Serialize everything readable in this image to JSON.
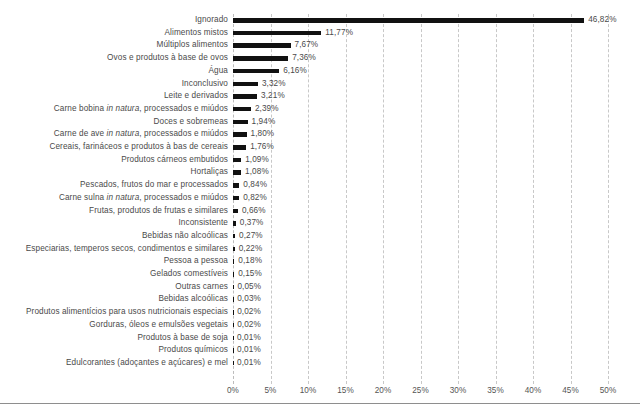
{
  "chart_data": {
    "type": "bar",
    "orientation": "horizontal",
    "title": "",
    "subtitle": "",
    "xlabel": "",
    "ylabel": "",
    "xlim": [
      0,
      50
    ],
    "grid": true,
    "grid_axis": "x",
    "grid_style": "dashed",
    "legend": "none",
    "bar_color": "#111111",
    "text_color": "#4a4a4a",
    "gridline_color": "#c8c8c8",
    "value_suffix": "%",
    "decimal_separator": ",",
    "xticks": [
      0,
      5,
      10,
      15,
      20,
      25,
      30,
      35,
      40,
      45,
      50
    ],
    "xtick_labels": [
      "0%",
      "5%",
      "10%",
      "15%",
      "20%",
      "25%",
      "30%",
      "35%",
      "40%",
      "45%",
      "50%"
    ],
    "categories": [
      "Ignorado",
      "Alimentos mistos",
      "Múltiplos alimentos",
      "Ovos e produtos à base de ovos",
      "Água",
      "Inconclusivo",
      "Leite e derivados",
      "Carne bobina in natura, processados e miúdos",
      "Doces e sobremeas",
      "Carne de ave in natura, processados e miúdos",
      "Cereais, farináceos e produtos à bas de cereais",
      "Produtos cárneos embutidos",
      "Hortaliças",
      "Pescados, frutos do mar e processados",
      "Carne sulna in natura, processados e miúdos",
      "Frutas, produtos de frutas e similares",
      "Inconsistente",
      "Bebidas não alcoólicas",
      "Especiarias, temperos secos, condimentos e similares",
      "Pessoa a pessoa",
      "Gelados comestíveis",
      "Outras carnes",
      "Bebidas alcoólicas",
      "Produtos alimentícios para usos nutricionais especiais",
      "Gorduras, óleos e emulsões vegetais",
      "Produtos à base de soja",
      "Produtos químicos",
      "Edulcorantes (adoçantes e açúcares) e mel"
    ],
    "values": [
      46.82,
      11.77,
      7.67,
      7.36,
      6.16,
      3.32,
      3.21,
      2.39,
      1.94,
      1.8,
      1.76,
      1.09,
      1.08,
      0.84,
      0.82,
      0.66,
      0.37,
      0.27,
      0.22,
      0.18,
      0.15,
      0.05,
      0.03,
      0.02,
      0.02,
      0.01,
      0.01,
      0.01
    ],
    "value_labels": [
      "46,82%",
      "11,77%",
      "7,67%",
      "7,36%",
      "6,16%",
      "3,32%",
      "3,21%",
      "2,39%",
      "1,94%",
      "1,80%",
      "1,76%",
      "1,09%",
      "1,08%",
      "0,84%",
      "0,82%",
      "0,66%",
      "0,37%",
      "0,27%",
      "0,22%",
      "0,18%",
      "0,15%",
      "0,05%",
      "0,03%",
      "0,02%",
      "0,02%",
      "0,01%",
      "0,01%",
      "0,01%"
    ],
    "category_label_parts": [
      {
        "pre": "Ignorado",
        "italic": "",
        "post": ""
      },
      {
        "pre": "Alimentos mistos",
        "italic": "",
        "post": ""
      },
      {
        "pre": "Múltiplos alimentos",
        "italic": "",
        "post": ""
      },
      {
        "pre": "Ovos e produtos à base de ovos",
        "italic": "",
        "post": ""
      },
      {
        "pre": "Água",
        "italic": "",
        "post": ""
      },
      {
        "pre": "Inconclusivo",
        "italic": "",
        "post": ""
      },
      {
        "pre": "Leite e derivados",
        "italic": "",
        "post": ""
      },
      {
        "pre": "Carne bobina ",
        "italic": "in natura",
        "post": ", processados e miúdos"
      },
      {
        "pre": "Doces e sobremeas",
        "italic": "",
        "post": ""
      },
      {
        "pre": "Carne de ave ",
        "italic": "in natura",
        "post": ", processados e miúdos"
      },
      {
        "pre": "Cereais, farináceos e produtos à bas de cereais",
        "italic": "",
        "post": ""
      },
      {
        "pre": "Produtos cárneos embutidos",
        "italic": "",
        "post": ""
      },
      {
        "pre": "Hortaliças",
        "italic": "",
        "post": ""
      },
      {
        "pre": "Pescados, frutos do mar e processados",
        "italic": "",
        "post": ""
      },
      {
        "pre": "Carne sulna ",
        "italic": "in natura",
        "post": ", processados e miúdos"
      },
      {
        "pre": "Frutas, produtos de frutas e similares",
        "italic": "",
        "post": ""
      },
      {
        "pre": "Inconsistente",
        "italic": "",
        "post": ""
      },
      {
        "pre": "Bebidas não alcoólicas",
        "italic": "",
        "post": ""
      },
      {
        "pre": "Especiarias, temperos secos, condimentos e similares",
        "italic": "",
        "post": ""
      },
      {
        "pre": "Pessoa a pessoa",
        "italic": "",
        "post": ""
      },
      {
        "pre": "Gelados comestíveis",
        "italic": "",
        "post": ""
      },
      {
        "pre": "Outras carnes",
        "italic": "",
        "post": ""
      },
      {
        "pre": "Bebidas alcoólicas",
        "italic": "",
        "post": ""
      },
      {
        "pre": "Produtos alimentícios para usos nutricionais especiais",
        "italic": "",
        "post": ""
      },
      {
        "pre": "Gorduras, óleos e emulsões vegetais",
        "italic": "",
        "post": ""
      },
      {
        "pre": "Produtos à base de soja",
        "italic": "",
        "post": ""
      },
      {
        "pre": "Produtos químicos",
        "italic": "",
        "post": ""
      },
      {
        "pre": "Edulcorantes (adoçantes e açúcares) e mel",
        "italic": "",
        "post": ""
      }
    ]
  }
}
